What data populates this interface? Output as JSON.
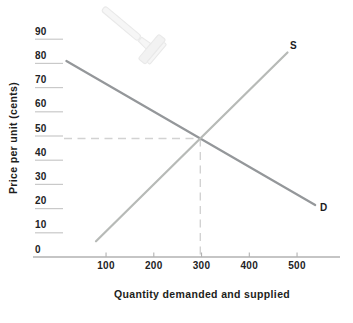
{
  "chart_data": {
    "type": "line",
    "title": "",
    "xlabel": "Quantity demanded and supplied",
    "ylabel": "Price per unit (cents)",
    "x_ticks": [
      100,
      200,
      300,
      400,
      500
    ],
    "y_ticks": [
      0,
      10,
      20,
      30,
      40,
      50,
      60,
      70,
      80,
      90
    ],
    "xlim": [
      0,
      590
    ],
    "ylim": [
      0,
      92
    ],
    "legend_position": "inline-end-labels",
    "grid": "y-tick-stubs-only",
    "series": [
      {
        "name": "Demand",
        "label": "D",
        "color": "#94979a",
        "points": [
          [
            17,
            81
          ],
          [
            538,
            21.5
          ]
        ]
      },
      {
        "name": "Supply",
        "label": "S",
        "color": "#b7bab7",
        "points": [
          [
            79,
            6.5
          ],
          [
            480,
            84.5
          ]
        ]
      }
    ],
    "equilibrium": {
      "quantity": 300,
      "price_cents": 48
    }
  },
  "icons": {
    "watermark": "razor"
  },
  "colors": {
    "background": "#ffffff",
    "axis_line": "#b2b2b2",
    "tick_stub": "#c9c9c9",
    "dashed_guide": "#d2d2d2",
    "text": "#222325",
    "watermark_fill": "#f5f5f5",
    "watermark_stroke": "#e9e9e9"
  }
}
